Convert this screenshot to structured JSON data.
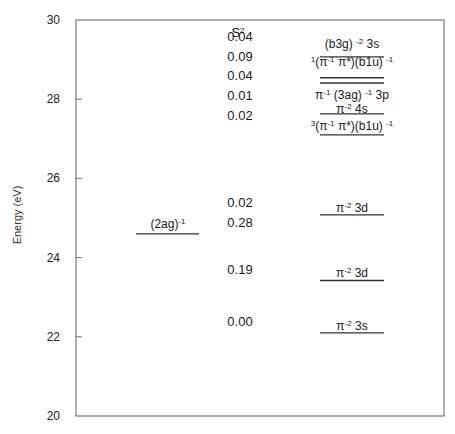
{
  "chart_data": {
    "type": "energy-level-diagram",
    "title": "",
    "ylabel": "Energy (eV)",
    "xlabel": "",
    "ylim": [
      20,
      30
    ],
    "yticks": [
      20,
      22,
      24,
      26,
      28,
      30
    ],
    "grid": false,
    "s2_header": {
      "base": "S",
      "sup": "2"
    },
    "s2_values": [
      {
        "value": "0.04",
        "energy": 29.6
      },
      {
        "value": "0.09",
        "energy": 29.1
      },
      {
        "value": "0.04",
        "energy": 28.6
      },
      {
        "value": "0.01",
        "energy": 28.1
      },
      {
        "value": "0.02",
        "energy": 27.6
      },
      {
        "value": "0.02",
        "energy": 25.4
      },
      {
        "value": "0.28",
        "energy": 24.9
      },
      {
        "value": "0.19",
        "energy": 23.7
      },
      {
        "value": "0.00",
        "energy": 22.4
      }
    ],
    "left_levels": [
      {
        "energy": 24.6,
        "label": [
          {
            "t": "(2ag)"
          },
          {
            "t": "-1",
            "sup": true
          }
        ]
      }
    ],
    "right_levels": [
      {
        "energy": 29.07,
        "label_energy": 29.4,
        "label": [
          {
            "t": "(b3g) "
          },
          {
            "t": "-2",
            "sup": true
          },
          {
            "t": " 3s"
          }
        ]
      },
      {
        "energy": 28.54,
        "label_energy": 28.95,
        "label": [
          {
            "t": "1",
            "sup": true
          },
          {
            "t": "(π"
          },
          {
            "t": "-1",
            "sup": true
          },
          {
            "t": " π*)(b1u) "
          },
          {
            "t": "-1",
            "sup": true
          }
        ]
      },
      {
        "energy": 28.41,
        "label_energy": 28.1,
        "label": [
          {
            "t": "π"
          },
          {
            "t": "-1",
            "sup": true
          },
          {
            "t": " (3ag) "
          },
          {
            "t": "-1",
            "sup": true
          },
          {
            "t": " 3p"
          }
        ]
      },
      {
        "energy": 27.63,
        "label_energy": 27.75,
        "label": [
          {
            "t": "π"
          },
          {
            "t": "-2",
            "sup": true
          },
          {
            "t": " 4s"
          }
        ]
      },
      {
        "energy": 27.1,
        "label_energy": 27.32,
        "label": [
          {
            "t": "3",
            "sup": true
          },
          {
            "t": "(π"
          },
          {
            "t": "-1",
            "sup": true
          },
          {
            "t": " π*)(b1u) "
          },
          {
            "t": "-1",
            "sup": true
          }
        ]
      },
      {
        "energy": 25.08,
        "label_energy": 25.25,
        "label": [
          {
            "t": "π"
          },
          {
            "t": "-2",
            "sup": true
          },
          {
            "t": " 3d"
          }
        ]
      },
      {
        "energy": 23.42,
        "label_energy": 23.6,
        "label": [
          {
            "t": "π"
          },
          {
            "t": "-2",
            "sup": true
          },
          {
            "t": " 3d"
          }
        ]
      },
      {
        "energy": 22.1,
        "label_energy": 22.28,
        "label": [
          {
            "t": "π"
          },
          {
            "t": "-2",
            "sup": true
          },
          {
            "t": " 3s"
          }
        ]
      }
    ]
  }
}
